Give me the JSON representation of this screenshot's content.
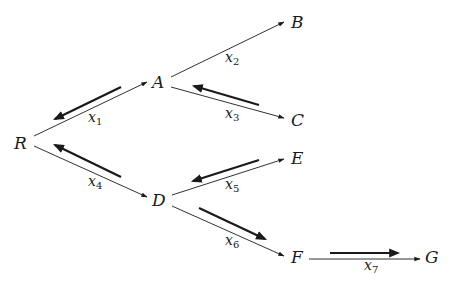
{
  "diagram": {
    "type": "directed tree with flow arrows",
    "colors": {
      "ink": "#1a1a1a",
      "background": "#ffffff"
    },
    "nodes": [
      {
        "id": "R",
        "label": "R",
        "x": 20,
        "y": 149
      },
      {
        "id": "A",
        "label": "A",
        "x": 160,
        "y": 88
      },
      {
        "id": "B",
        "label": "B",
        "x": 297,
        "y": 28
      },
      {
        "id": "C",
        "label": "C",
        "x": 297,
        "y": 126
      },
      {
        "id": "D",
        "label": "D",
        "x": 160,
        "y": 206
      },
      {
        "id": "E",
        "label": "E",
        "x": 297,
        "y": 164
      },
      {
        "id": "F",
        "label": "F",
        "x": 297,
        "y": 263
      },
      {
        "id": "G",
        "label": "G",
        "x": 432,
        "y": 263
      }
    ],
    "edges": [
      {
        "from": "R",
        "to": "A",
        "label": "x",
        "sub": "1",
        "flow": "toward R"
      },
      {
        "from": "A",
        "to": "B",
        "label": "x",
        "sub": "2",
        "flow": "none"
      },
      {
        "from": "A",
        "to": "C",
        "label": "x",
        "sub": "3",
        "flow": "toward A"
      },
      {
        "from": "R",
        "to": "D",
        "label": "x",
        "sub": "4",
        "flow": "toward R"
      },
      {
        "from": "D",
        "to": "E",
        "label": "x",
        "sub": "5",
        "flow": "toward D"
      },
      {
        "from": "D",
        "to": "F",
        "label": "x",
        "sub": "6",
        "flow": "toward F"
      },
      {
        "from": "F",
        "to": "G",
        "label": "x",
        "sub": "7",
        "flow": "toward G"
      }
    ]
  }
}
